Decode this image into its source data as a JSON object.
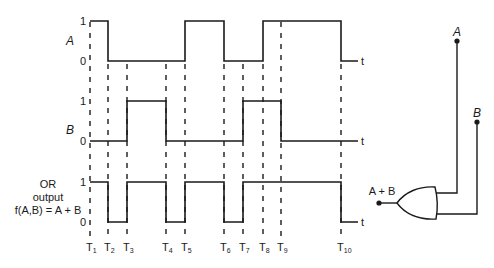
{
  "chart_data": {
    "type": "timing-diagram",
    "time_axis_label": "t",
    "time_markers": [
      {
        "main": "T",
        "sub": "1"
      },
      {
        "main": "T",
        "sub": "2"
      },
      {
        "main": "T",
        "sub": "3"
      },
      {
        "main": "T",
        "sub": "4"
      },
      {
        "main": "T",
        "sub": "5"
      },
      {
        "main": "T",
        "sub": "6"
      },
      {
        "main": "T",
        "sub": "7"
      },
      {
        "main": "T",
        "sub": "8"
      },
      {
        "main": "T",
        "sub": "9"
      },
      {
        "main": "T",
        "sub": "10"
      }
    ],
    "interval_note": "levels[i] is the logic level between marker i and marker i+1; last entry is after T10",
    "signals": [
      {
        "id": "A",
        "label_lines": [
          "A"
        ],
        "italic": true,
        "high_label": "1",
        "low_label": "0",
        "levels": [
          1,
          0,
          0,
          0,
          1,
          0,
          0,
          1,
          1,
          0
        ]
      },
      {
        "id": "B",
        "label_lines": [
          "B"
        ],
        "italic": true,
        "high_label": "1",
        "low_label": "0",
        "levels": [
          0,
          0,
          1,
          0,
          0,
          0,
          1,
          1,
          0,
          0
        ]
      },
      {
        "id": "OR",
        "label_lines": [
          "OR",
          "output",
          "f(A,B) = A + B"
        ],
        "italic": false,
        "high_label": "1",
        "low_label": "0",
        "levels": [
          1,
          0,
          1,
          0,
          1,
          0,
          1,
          1,
          1,
          0
        ]
      }
    ]
  },
  "gate": {
    "type": "OR",
    "input_a_label": "A",
    "input_b_label": "B",
    "output_label": "A + B"
  },
  "colors": {
    "ink": "#1a1a1a",
    "background": "#ffffff"
  }
}
